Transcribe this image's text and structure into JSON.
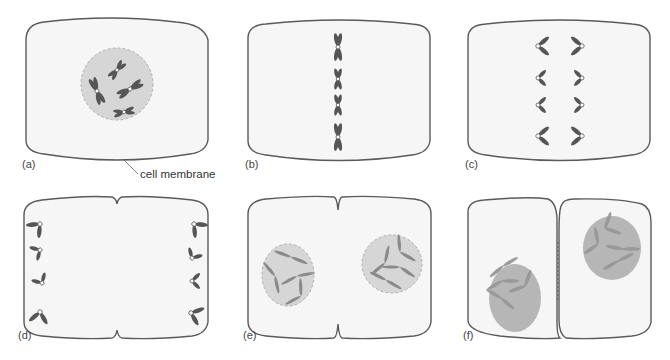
{
  "figure": {
    "panels": [
      {
        "id": "a",
        "label": "(a)",
        "description": "Interphase/prophase: cell with nucleus containing condensed chromosomes"
      },
      {
        "id": "b",
        "label": "(b)",
        "description": "Metaphase: chromosomes aligned at cell equator"
      },
      {
        "id": "c",
        "label": "(c)",
        "description": "Anaphase: sister chromatids separating toward poles"
      },
      {
        "id": "d",
        "label": "(d)",
        "description": "Late anaphase: chromatids at poles, cleavage furrow begins"
      },
      {
        "id": "e",
        "label": "(e)",
        "description": "Telophase: nuclear envelopes re-form in two nuclei"
      },
      {
        "id": "f",
        "label": "(f)",
        "description": "Cytokinesis: two daughter cells separated"
      }
    ],
    "annotations": {
      "cell_membrane": "cell membrane"
    }
  },
  "colors": {
    "cell_fill": "#f6f6f6",
    "outline": "#5a5a5a",
    "nucleus": "#d6d6d6",
    "nucleus_daughter": "#b6b6b6",
    "chromosome": "#555555"
  }
}
